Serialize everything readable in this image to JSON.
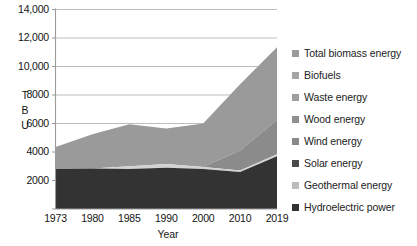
{
  "chart_data": {
    "type": "area",
    "stacked": true,
    "title": "",
    "xlabel": "Year",
    "ylabel": "T B U",
    "categories": [
      "1973",
      "1980",
      "1985",
      "1990",
      "2000",
      "2010",
      "2019"
    ],
    "x_tick_labels": [
      "1973",
      "1980",
      "1985",
      "1990",
      "2000",
      "2010",
      "2019"
    ],
    "y_tick_labels": [
      "14,000",
      "12,000",
      "10,000",
      "8000",
      "6000",
      "4000",
      "2000"
    ],
    "y_tick_values": [
      14000,
      12000,
      10000,
      8000,
      6000,
      4000,
      2000
    ],
    "ylim": [
      0,
      14000
    ],
    "grid": true,
    "legend_position": "right",
    "series": [
      {
        "name": "Total biomass energy",
        "color": "#9a9a9a",
        "values": [
          1550,
          2100,
          2350,
          2250,
          2700,
          4500,
          5100
        ]
      },
      {
        "name": "Biofuels",
        "color": "#a5a5a5",
        "values": [
          0,
          0,
          0,
          0,
          0,
          1400,
          2400
        ]
      },
      {
        "name": "Waste energy",
        "color": "#9e9e9e",
        "values": [
          0,
          0,
          0,
          0,
          0,
          0,
          0
        ]
      },
      {
        "name": "Wood energy",
        "color": "#8f8f8f",
        "values": [
          0,
          0,
          0,
          0,
          0,
          0,
          0
        ]
      },
      {
        "name": "Wind energy",
        "color": "#888888",
        "values": [
          0,
          0,
          0,
          0,
          0,
          0,
          0
        ]
      },
      {
        "name": "Solar energy",
        "color": "#4a4a4a",
        "values": [
          0,
          0,
          0,
          0,
          0,
          0,
          0
        ]
      },
      {
        "name": "Geothermal energy",
        "color": "#bdbdbd",
        "values": [
          0,
          0,
          200,
          250,
          150,
          100,
          150
        ]
      },
      {
        "name": "Hydroelectric power",
        "color": "#333333",
        "values": [
          2800,
          2850,
          2800,
          2900,
          2800,
          2600,
          3700
        ]
      }
    ],
    "stack_tops": {
      "hydroelectric": [
        2800,
        2850,
        2800,
        2900,
        2800,
        2600,
        3700
      ],
      "geothermal": [
        2800,
        2850,
        3000,
        3150,
        2950,
        2700,
        3850
      ],
      "biofuels": [
        2800,
        2850,
        3000,
        3150,
        2950,
        4100,
        6250
      ],
      "total": [
        4350,
        5250,
        5950,
        5650,
        6000,
        8750,
        11350
      ]
    },
    "colors": {
      "plot_background": "#ffffff",
      "gridline": "#b5b5b5",
      "axis_line": "#9b9b9b",
      "biomass_band": "#9a9a9a",
      "biofuels_band": "#8b8b8b",
      "geothermal_line": "#d2d2d2",
      "hydro_band": "#333333",
      "text": "#141414"
    }
  },
  "legend": {
    "items": [
      {
        "label": "Total biomass energy",
        "color": "#9a9a9a"
      },
      {
        "label": "Biofuels",
        "color": "#a5a5a5"
      },
      {
        "label": "Waste energy",
        "color": "#9e9e9e"
      },
      {
        "label": "Wood energy",
        "color": "#8f8f8f"
      },
      {
        "label": "Wind energy",
        "color": "#888888"
      },
      {
        "label": "Solar energy",
        "color": "#4a4a4a"
      },
      {
        "label": "Geothermal energy",
        "color": "#bdbdbd"
      },
      {
        "label": "Hydroelectric power",
        "color": "#333333"
      }
    ]
  },
  "axes": {
    "y_title_chars": [
      "T",
      "B",
      "U"
    ],
    "x_title": "Year"
  }
}
